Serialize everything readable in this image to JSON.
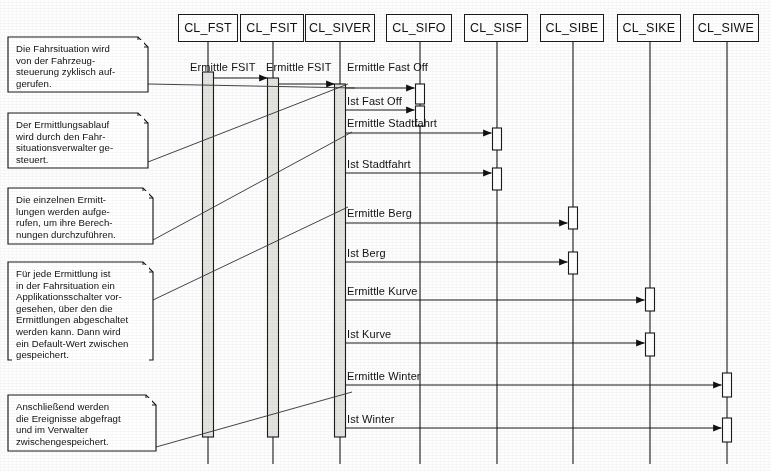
{
  "diagram": {
    "type": "uml-sequence-diagram",
    "title": "",
    "background_color": "#fdfdfd",
    "line_color": "#1a1a1a",
    "activation_fill": "#e3e3e0"
  },
  "lifelines": [
    {
      "id": "fst",
      "label": "CL_FST",
      "x": 208,
      "box_left": 178,
      "box_width": 60,
      "activation": {
        "top": 72,
        "bottom": 437,
        "width": 11,
        "style": "gray"
      }
    },
    {
      "id": "fsit",
      "label": "CL_FSIT",
      "x": 273,
      "box_left": 240,
      "box_width": 64,
      "activation": {
        "top": 78,
        "bottom": 437,
        "width": 11,
        "style": "gray"
      }
    },
    {
      "id": "siver",
      "label": "CL_SIVER",
      "x": 340,
      "box_left": 305,
      "box_width": 70,
      "activation": {
        "top": 84,
        "bottom": 437,
        "width": 11,
        "style": "gray"
      }
    },
    {
      "id": "sifo",
      "label": "CL_SIFO",
      "x": 420,
      "box_left": 386,
      "box_width": 66,
      "activation": null
    },
    {
      "id": "sisf",
      "label": "CL_SISF",
      "x": 497,
      "box_left": 464,
      "box_width": 64,
      "activation": null
    },
    {
      "id": "sibe",
      "label": "CL_SIBE",
      "x": 573,
      "box_left": 540,
      "box_width": 64,
      "activation": null
    },
    {
      "id": "sike",
      "label": "CL_SIKE",
      "x": 650,
      "box_left": 617,
      "box_width": 64,
      "activation": null
    },
    {
      "id": "siwe",
      "label": "CL_SIWE",
      "x": 727,
      "box_left": 693,
      "box_width": 66,
      "activation": null
    }
  ],
  "messages": [
    {
      "label": "Ermittle FSIT",
      "from": "fst",
      "to": "fsit",
      "y": 78,
      "label_x": 190,
      "label_y": 61
    },
    {
      "label": "Ermittle FSIT",
      "from": "fsit",
      "to": "siver",
      "y": 84,
      "label_x": 266,
      "label_y": 61
    },
    {
      "label": "Ermittle Fast Off",
      "from": "siver",
      "to": "sifo",
      "y": 88,
      "label_x": 347,
      "label_y": 61
    },
    {
      "label": "Ist Fast Off",
      "from": "siver",
      "to": "sifo",
      "y": 110,
      "label_x": 347,
      "label_y": 95
    },
    {
      "label": "Ermittle Stadtfahrt",
      "from": "siver",
      "to": "sisf",
      "y": 133,
      "label_x": 347,
      "label_y": 117
    },
    {
      "label": "Ist Stadtfahrt",
      "from": "siver",
      "to": "sisf",
      "y": 173,
      "label_x": 347,
      "label_y": 158
    },
    {
      "label": "Ermittle Berg",
      "from": "siver",
      "to": "sibe",
      "y": 223,
      "label_x": 347,
      "label_y": 207
    },
    {
      "label": "Ist Berg",
      "from": "siver",
      "to": "sibe",
      "y": 262,
      "label_x": 347,
      "label_y": 247
    },
    {
      "label": "Ermittle Kurve",
      "from": "siver",
      "to": "sike",
      "y": 300,
      "label_x": 347,
      "label_y": 285
    },
    {
      "label": "Ist Kurve",
      "from": "siver",
      "to": "sike",
      "y": 343,
      "label_x": 347,
      "label_y": 328
    },
    {
      "label": "Ermittle Winter",
      "from": "siver",
      "to": "siwe",
      "y": 385,
      "label_x": 347,
      "label_y": 370
    },
    {
      "label": "Ist Winter",
      "from": "siver",
      "to": "siwe",
      "y": 428,
      "label_x": 347,
      "label_y": 413
    }
  ],
  "receiver_activations": [
    {
      "lifeline": "sifo",
      "top": 84,
      "height": 20
    },
    {
      "lifeline": "sifo",
      "top": 106,
      "height": 20
    },
    {
      "lifeline": "sisf",
      "top": 128,
      "height": 22
    },
    {
      "lifeline": "sisf",
      "top": 168,
      "height": 22
    },
    {
      "lifeline": "sibe",
      "top": 207,
      "height": 22
    },
    {
      "lifeline": "sibe",
      "top": 252,
      "height": 22
    },
    {
      "lifeline": "sike",
      "top": 288,
      "height": 23
    },
    {
      "lifeline": "sike",
      "top": 333,
      "height": 23
    },
    {
      "lifeline": "siwe",
      "top": 373,
      "height": 24
    },
    {
      "lifeline": "siwe",
      "top": 418,
      "height": 24
    }
  ],
  "notes": [
    {
      "id": "note-1",
      "text": "Die Fahrsituation wird\nvon der Fahrzeug-\nsteuerung zyklisch auf-\ngerufen.",
      "left": 8,
      "top": 37,
      "width": 140,
      "height": 55,
      "connector": {
        "x1": 148,
        "y1": 84,
        "x2": 355,
        "y2": 88
      }
    },
    {
      "id": "note-2",
      "text": "Der Ermittlungsablauf\nwird durch den Fahr-\nsituationsverwalter ge-\nsteuert.",
      "left": 8,
      "top": 113,
      "width": 140,
      "height": 55,
      "connector": {
        "x1": 148,
        "y1": 162,
        "x2": 348,
        "y2": 84
      }
    },
    {
      "id": "note-3",
      "text": "Die einzelnen Ermitt-\nlungen werden aufge-\nrufen, um ihre Berech-\nnungen durchzuführen.",
      "left": 8,
      "top": 188,
      "width": 145,
      "height": 56,
      "connector": {
        "x1": 153,
        "y1": 240,
        "x2": 352,
        "y2": 132
      }
    },
    {
      "id": "note-4",
      "text": "Für jede Ermittlung ist\nin der Fahrsituation ein\nApplikationsschalter vor-\ngesehen, über den die\nErmittlungen abgeschaltet\nwerden kann. Dann wird\nein Default-Wert zwischen\ngespeichert.",
      "left": 8,
      "top": 262,
      "width": 145,
      "height": 98,
      "connector": {
        "x1": 153,
        "y1": 300,
        "x2": 348,
        "y2": 207
      }
    },
    {
      "id": "note-5",
      "text": "Anschließend werden\ndie Ereignisse abgefragt\nund im Verwalter\nzwischengespeichert.",
      "left": 8,
      "top": 395,
      "width": 148,
      "height": 56,
      "connector": {
        "x1": 156,
        "y1": 447,
        "x2": 352,
        "y2": 392
      }
    }
  ],
  "icons": {
    "arrowhead": "solid-triangle-right",
    "note_corner": "folded-corner"
  }
}
